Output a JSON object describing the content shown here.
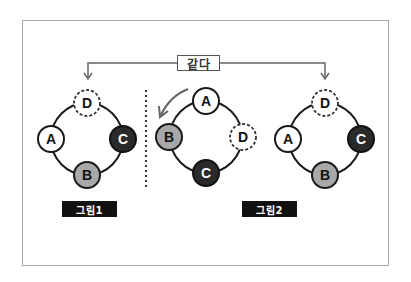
{
  "equal_label": "같다",
  "figures": [
    {
      "label": "그림1",
      "nodes": [
        {
          "id": "D",
          "style": "dashed",
          "position": "top"
        },
        {
          "id": "A",
          "style": "white",
          "position": "left"
        },
        {
          "id": "C",
          "style": "dark",
          "position": "right"
        },
        {
          "id": "B",
          "style": "gray",
          "position": "bottom"
        }
      ]
    },
    {
      "label": "그림2",
      "rotated_nodes": [
        {
          "id": "A",
          "style": "white",
          "position": "top"
        },
        {
          "id": "B",
          "style": "gray",
          "position": "left"
        },
        {
          "id": "D",
          "style": "dashed",
          "position": "right"
        },
        {
          "id": "C",
          "style": "dark",
          "position": "bottom"
        }
      ],
      "nodes": [
        {
          "id": "D",
          "style": "dashed",
          "position": "top"
        },
        {
          "id": "A",
          "style": "white",
          "position": "left"
        },
        {
          "id": "C",
          "style": "dark",
          "position": "right"
        },
        {
          "id": "B",
          "style": "gray",
          "position": "bottom"
        }
      ]
    }
  ],
  "colors": {
    "white_node": "#ffffff",
    "gray_node": "#a8a8a8",
    "dark_node": "#2a2a2a",
    "outline": "#1a1a1a",
    "arrow": "#666666",
    "label_bg": "#111111"
  },
  "node_labels": {
    "f1_top": "D",
    "f1_left": "A",
    "f1_right": "C",
    "f1_bottom": "B",
    "f2_top": "A",
    "f2_left": "B",
    "f2_right": "D",
    "f2_bottom": "C",
    "f3_top": "D",
    "f3_left": "A",
    "f3_right": "C",
    "f3_bottom": "B"
  }
}
